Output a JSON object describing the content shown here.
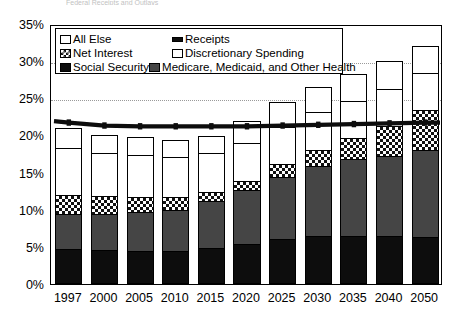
{
  "title": "Federal Receipts and Outlays",
  "legend": {
    "items": [
      {
        "key": "all_else",
        "label": "All Else",
        "swatch": "white-square-icon"
      },
      {
        "key": "receipts",
        "label": "Receipts",
        "swatch": "black-line-icon"
      },
      {
        "key": "net_interest",
        "label": "Net Interest",
        "swatch": "checkered-square-icon"
      },
      {
        "key": "discretionary",
        "label": "Discretionary Spending",
        "swatch": "white-square-icon"
      },
      {
        "key": "social_security",
        "label": "Social Security",
        "swatch": "black-square-icon"
      },
      {
        "key": "health",
        "label": "Medicare, Medicaid, and Other Health",
        "swatch": "dark-gray-square-icon"
      }
    ]
  },
  "colors": {
    "social_security": "#0d0d0d",
    "health": "#454545",
    "net_interest": "#ffffff",
    "discretionary": "#ffffff",
    "all_else": "#ffffff",
    "receipts_line": "#0d0d0d",
    "axis": "#000000",
    "gridline": "#9a9a9a"
  },
  "chart_data": {
    "type": "bar",
    "stacked": true,
    "title": "Federal Receipts and Outlays",
    "xlabel": "",
    "ylabel": "",
    "ylim": [
      0,
      35
    ],
    "yticks": [
      0,
      5,
      10,
      15,
      20,
      25,
      30,
      35
    ],
    "ytick_labels": [
      "0%",
      "5%",
      "10%",
      "15%",
      "20%",
      "25%",
      "30%",
      "35%"
    ],
    "gridlines_at": [
      25,
      30
    ],
    "grid": "dotted-horizontal-at-25-and-30",
    "legend_position": "top-left-inside",
    "categories": [
      "1997",
      "2000",
      "2005",
      "2010",
      "2015",
      "2020",
      "2025",
      "2030",
      "2035",
      "2040",
      "2050"
    ],
    "series": [
      {
        "name": "Social Security",
        "values": [
          4.7,
          4.6,
          4.5,
          4.5,
          4.9,
          5.4,
          6.0,
          6.4,
          6.5,
          6.4,
          6.3
        ]
      },
      {
        "name": "Medicare, Medicaid, and Other Health",
        "values": [
          4.7,
          4.8,
          5.2,
          5.5,
          6.3,
          7.2,
          8.4,
          9.5,
          10.3,
          10.9,
          11.8
        ]
      },
      {
        "name": "Net Interest",
        "values": [
          2.6,
          2.4,
          2.0,
          1.7,
          1.2,
          1.3,
          1.7,
          2.2,
          2.9,
          4.0,
          5.3
        ]
      },
      {
        "name": "Discretionary Spending",
        "values": [
          6.3,
          5.9,
          5.7,
          5.4,
          5.2,
          5.1,
          5.0,
          5.0,
          5.0,
          5.0,
          5.0
        ]
      },
      {
        "name": "All Else",
        "values": [
          2.7,
          2.3,
          2.4,
          2.3,
          2.3,
          3.0,
          3.4,
          3.4,
          3.6,
          3.7,
          3.6
        ]
      }
    ],
    "totals": [
      21.0,
      20.0,
      19.8,
      19.4,
      19.9,
      22.0,
      24.5,
      26.5,
      28.3,
      30.0,
      32.0
    ],
    "line_series": {
      "name": "Receipts",
      "values": [
        22.0,
        21.6,
        21.5,
        21.5,
        21.5,
        21.5,
        21.6,
        21.7,
        21.8,
        21.9,
        22.0
      ]
    }
  }
}
